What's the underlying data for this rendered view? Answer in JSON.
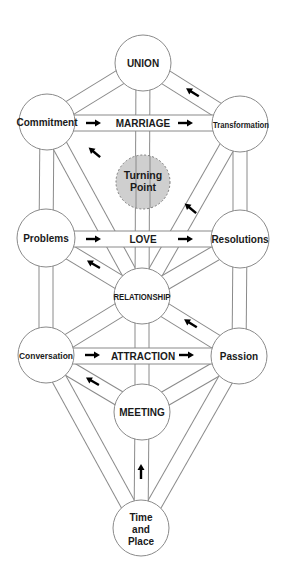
{
  "diagram": {
    "colors": {
      "background": "#ffffff",
      "outline": "#8a8a8a",
      "turning_point_fill": "#cfcfcf",
      "text": "#1a1a1a",
      "arrow": "#000000"
    },
    "nodes": [
      {
        "id": "union",
        "label": "UNION",
        "x": 143,
        "y": 63,
        "r": 28
      },
      {
        "id": "commitment",
        "label": "Commitment",
        "x": 47,
        "y": 122,
        "r": 28
      },
      {
        "id": "transformation",
        "label": "Transformation",
        "x": 240,
        "y": 124,
        "r": 28
      },
      {
        "id": "turning_point",
        "label_line1": "Turning",
        "label_line2": "Point",
        "x": 143,
        "y": 182,
        "r": 27,
        "style": "dashed-gray"
      },
      {
        "id": "problems",
        "label": "Problems",
        "x": 46,
        "y": 238,
        "r": 29
      },
      {
        "id": "resolutions",
        "label": "Resolutions",
        "x": 240,
        "y": 239,
        "r": 29
      },
      {
        "id": "relationship",
        "label": "RELATIONSHIP",
        "x": 142,
        "y": 296,
        "r": 28
      },
      {
        "id": "conversation",
        "label": "Conversation",
        "x": 46,
        "y": 355,
        "r": 28
      },
      {
        "id": "passion",
        "label": "Passion",
        "x": 239,
        "y": 356,
        "r": 28
      },
      {
        "id": "meeting",
        "label": "MEETING",
        "x": 142,
        "y": 412,
        "r": 28
      },
      {
        "id": "time_and_place",
        "label_line1": "Time",
        "label_line2": "and",
        "label_line3": "Place",
        "x": 141,
        "y": 528,
        "r": 28
      }
    ],
    "paths": [
      {
        "id": "marriage",
        "label": "MARRIAGE",
        "from": "commitment",
        "to": "transformation",
        "arrows": [
          "right",
          "right"
        ]
      },
      {
        "id": "love",
        "label": "LOVE",
        "from": "problems",
        "to": "resolutions",
        "arrows": [
          "right",
          "right"
        ]
      },
      {
        "id": "attraction",
        "label": "ATTRACTION",
        "from": "conversation",
        "to": "passion",
        "arrows": [
          "right",
          "right"
        ]
      }
    ],
    "edges": [
      [
        "union",
        "commitment"
      ],
      [
        "union",
        "transformation"
      ],
      [
        "union",
        "relationship"
      ],
      [
        "commitment",
        "problems"
      ],
      [
        "commitment",
        "relationship"
      ],
      [
        "transformation",
        "resolutions"
      ],
      [
        "transformation",
        "relationship"
      ],
      [
        "problems",
        "conversation"
      ],
      [
        "problems",
        "relationship"
      ],
      [
        "resolutions",
        "passion"
      ],
      [
        "resolutions",
        "relationship"
      ],
      [
        "relationship",
        "meeting"
      ],
      [
        "relationship",
        "conversation"
      ],
      [
        "relationship",
        "passion"
      ],
      [
        "conversation",
        "meeting"
      ],
      [
        "conversation",
        "time_and_place"
      ],
      [
        "passion",
        "meeting"
      ],
      [
        "passion",
        "time_and_place"
      ],
      [
        "meeting",
        "time_and_place"
      ]
    ],
    "direction_arrows": [
      {
        "on": "transformation-union",
        "direction": "up-left"
      },
      {
        "on": "relationship-commitment",
        "direction": "up-left"
      },
      {
        "on": "relationship-transformation",
        "direction": "up-left"
      },
      {
        "on": "relationship-problems",
        "direction": "up-left"
      },
      {
        "on": "passion-relationship",
        "direction": "up-left"
      },
      {
        "on": "meeting-conversation",
        "direction": "up-left"
      },
      {
        "on": "time_and_place-meeting",
        "direction": "up"
      }
    ]
  }
}
